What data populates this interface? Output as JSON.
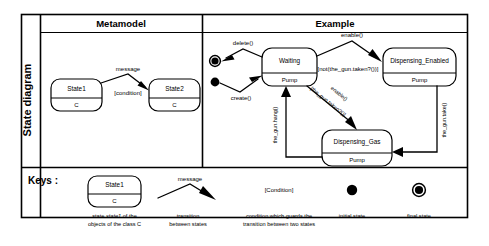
{
  "figure": {
    "row_label": "State diagram",
    "columns": [
      {
        "header": "Metamodel"
      },
      {
        "header": "Example"
      }
    ],
    "keys_label": "Keys :"
  },
  "metamodel": {
    "states": [
      {
        "name": "State1",
        "compartment": "C"
      },
      {
        "name": "State2",
        "compartment": "C"
      }
    ],
    "transition": {
      "message": "message",
      "condition": "[condition]"
    }
  },
  "example": {
    "states": [
      {
        "name": "Waiting",
        "compartment": "Pump"
      },
      {
        "name": "Dispensing_Enabled",
        "compartment": "Pump"
      },
      {
        "name": "Dispensing_Gas",
        "compartment": "Pump"
      }
    ],
    "pseudostates": [
      {
        "kind": "final-state"
      },
      {
        "kind": "initial-state"
      }
    ],
    "transitions": [
      {
        "label": "delete()"
      },
      {
        "label": "create()"
      },
      {
        "label": "enable()"
      },
      {
        "label": "[not(the_gun.taken?())]"
      },
      {
        "label": "enable()"
      },
      {
        "label": "[the_gun.taken?()]"
      },
      {
        "label": "the_gun.hang()"
      },
      {
        "label": "the_gun.take()"
      }
    ]
  },
  "keys": {
    "items": [
      {
        "icon": "state-shape",
        "state_name": "State1",
        "state_compartment": "C",
        "caption_line1_pre": "state ",
        "caption_line1_em": "state1",
        "caption_line1_post": " of the",
        "caption_line2": "objects of the class C"
      },
      {
        "icon": "transition-arrow",
        "sample_label": "message",
        "caption_line1": "transition",
        "caption_line2": "between states"
      },
      {
        "icon": "condition-text",
        "sample_label": "[Condition]",
        "caption_line1": "condition which guards the",
        "caption_line2": "transition between two states"
      },
      {
        "icon": "initial-state-icon",
        "caption_line1": "initial state",
        "caption_line2": ""
      },
      {
        "icon": "final-state-icon",
        "caption_line1": "final state",
        "caption_line2": ""
      }
    ]
  },
  "colors": {
    "stroke": "#000000",
    "background": "#ffffff"
  }
}
